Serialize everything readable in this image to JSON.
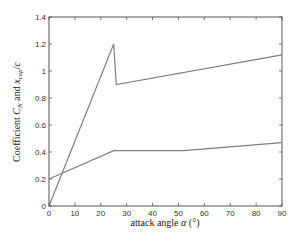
{
  "chart_data": {
    "type": "line",
    "title": "",
    "xlabel": "attack angle α (°)",
    "ylabel": "Coefficient C_N and x_cop/c",
    "xlim": [
      0,
      90
    ],
    "ylim": [
      0,
      1.4
    ],
    "xticks": [
      0,
      10,
      20,
      30,
      40,
      50,
      60,
      70,
      80,
      90
    ],
    "yticks": [
      0,
      0.2,
      0.4,
      0.6,
      0.8,
      1,
      1.2,
      1.4
    ],
    "ytick_labels": [
      "0",
      "0.2",
      "0.4",
      "0.6",
      "0.8",
      "1",
      "1.2",
      "1.4"
    ],
    "grid": false,
    "legend": null,
    "series": [
      {
        "name": "C_N",
        "color": "#808080",
        "x": [
          0,
          25,
          26,
          90
        ],
        "y": [
          0,
          1.2,
          0.9,
          1.12
        ]
      },
      {
        "name": "x_cop/c",
        "color": "#808080",
        "x": [
          0,
          25,
          52,
          90
        ],
        "y": [
          0.2,
          0.41,
          0.41,
          0.47
        ]
      }
    ]
  }
}
